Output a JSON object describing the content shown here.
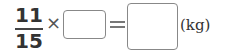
{
  "equation": {
    "fraction": {
      "numerator": "11",
      "denominator": "15"
    },
    "operator": "×",
    "multiplier_answer_box": {
      "value": ""
    },
    "equals": "=",
    "result_answer_box": {
      "value": ""
    },
    "unit": "(kg)"
  }
}
